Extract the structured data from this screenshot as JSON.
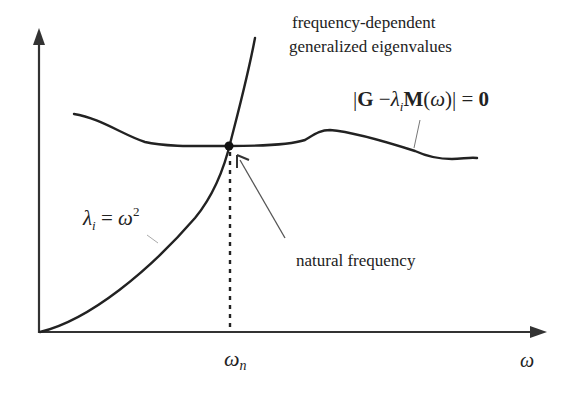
{
  "diagram": {
    "title_label": {
      "line1": "frequency-dependent",
      "line2": "generalized eigenvalues"
    },
    "equation_label": {
      "bar_open": "|",
      "G": "G",
      "minus": " −",
      "lambda": "λ",
      "sub_i": "i",
      "M": "M",
      "paren_open": "(",
      "omega": "ω",
      "paren_close": ")",
      "bar_close": "|",
      "equals": " = ",
      "zero": "0"
    },
    "parabola_label": {
      "lambda": "λ",
      "sub_i": "i",
      "equals": " = ",
      "omega": "ω",
      "sup": "2"
    },
    "natural_frequency_label": "natural frequency",
    "x_tick_label": {
      "omega": "ω",
      "sub": "n"
    },
    "x_axis_label": "ω",
    "colors": {
      "curve": "#222222",
      "axis": "#333333",
      "leader": "#555555"
    }
  }
}
